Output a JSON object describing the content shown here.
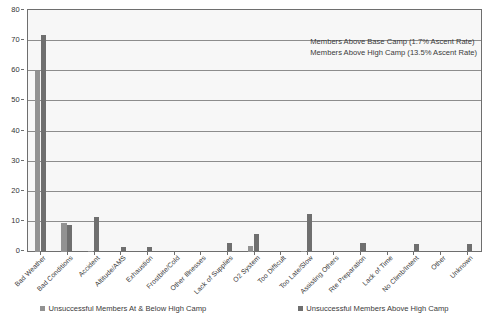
{
  "chart_data": {
    "type": "bar",
    "title": "",
    "xlabel": "",
    "ylabel": "",
    "ylim": [
      0,
      80
    ],
    "ytick_step": 10,
    "yticks": [
      "0",
      "10",
      "20",
      "30",
      "40",
      "50",
      "60",
      "70",
      "80"
    ],
    "grid": true,
    "legend_position": "bottom",
    "categories": [
      "Bad Weather",
      "Bad Conditions",
      "Accident",
      "Altitude/AMS",
      "Exhaustion",
      "Frostbite/Cold",
      "Other Illnesses",
      "Lack of Supplies",
      "O2 System",
      "Too Difficult",
      "Too Late/Slow",
      "Assisting Others",
      "Rte Preparation",
      "Lack of Time",
      "No Climb/Intent",
      "Other",
      "Unknown"
    ],
    "series": [
      {
        "name": "Unsuccessful Members At & Below High Camp",
        "color": "#929292",
        "values": [
          60,
          9.5,
          0.4,
          0,
          0,
          0,
          0,
          0,
          2,
          0,
          0.5,
          0,
          0,
          0,
          0,
          0,
          0
        ]
      },
      {
        "name": "Unsuccessful Members Above High Camp",
        "color": "#6f6f6f",
        "values": [
          72,
          9,
          11.5,
          1.5,
          1.5,
          0.3,
          0,
          3,
          6,
          0,
          12.5,
          0,
          3,
          0,
          2.5,
          0,
          2.5
        ]
      }
    ],
    "annotations": [
      "Members Above Base Camp (1.7% Ascent Rate)",
      "Members Above High Camp (13.5% Ascent Rate)"
    ]
  }
}
